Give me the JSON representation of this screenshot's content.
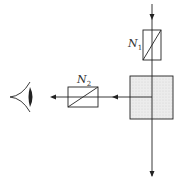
{
  "diagram": {
    "type": "optical-setup",
    "labels": {
      "polarizer_1": "N",
      "polarizer_1_sub": "1",
      "polarizer_2": "N",
      "polarizer_2_sub": "2"
    },
    "elements": [
      {
        "id": "polarizer-n1",
        "kind": "polarizer",
        "label": "N1"
      },
      {
        "id": "sample-block",
        "kind": "sample/beam-splitter",
        "fill": "#e6e6e6"
      },
      {
        "id": "polarizer-n2",
        "kind": "polarizer",
        "label": "N2"
      },
      {
        "id": "observer-eye",
        "kind": "eye"
      }
    ],
    "colors": {
      "stroke": "#222222",
      "block_fill": "#e4e4e4",
      "text": "#333333"
    }
  }
}
